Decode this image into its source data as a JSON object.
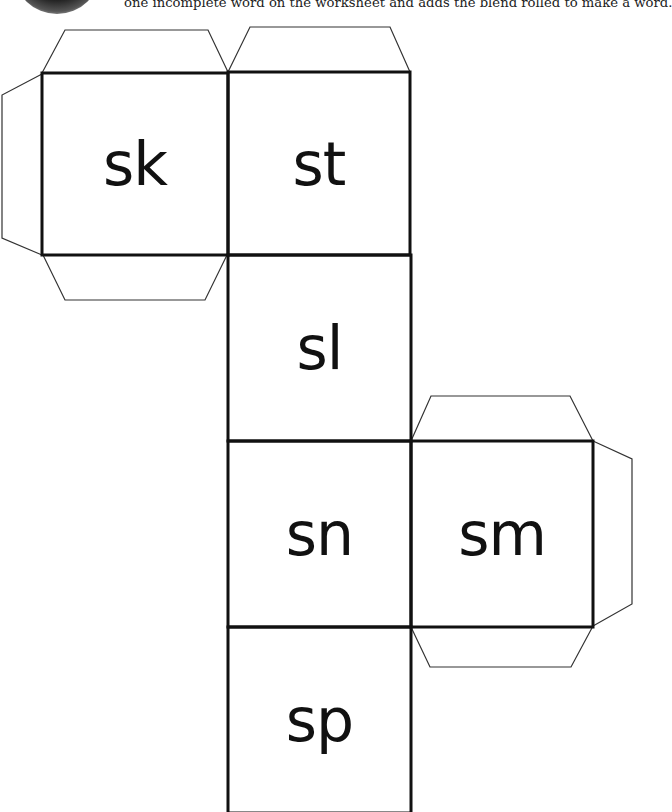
{
  "header": {
    "instructions": "one incomplete word on the worksheet and adds the blend rolled to make a word."
  },
  "cube": {
    "faces": [
      {
        "label": "sk"
      },
      {
        "label": "st"
      },
      {
        "label": "sl"
      },
      {
        "label": "sn"
      },
      {
        "label": "sm"
      },
      {
        "label": "sp"
      }
    ],
    "line_color": "#111111",
    "flap_color": "#333333"
  }
}
